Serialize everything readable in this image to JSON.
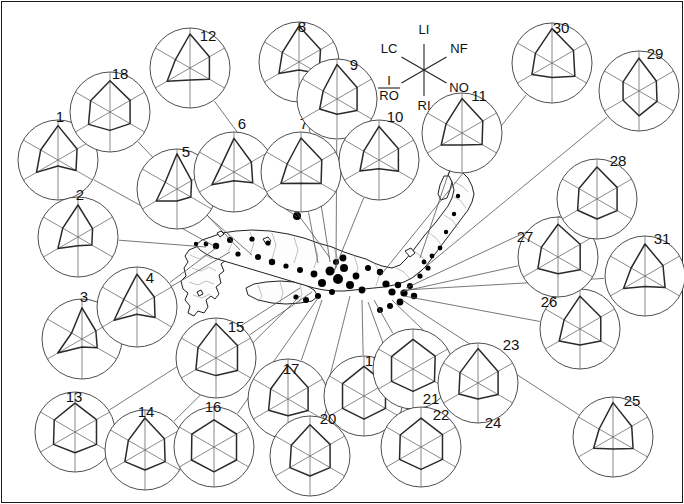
{
  "figure": {
    "title": "",
    "width": 684,
    "height": 504,
    "background_color": "#ffffff"
  },
  "legend": {
    "name": "axis-key",
    "center": {
      "x": 424,
      "y": 70
    },
    "radius": 26,
    "axes": [
      {
        "code": "LI",
        "label": "LI",
        "angle_deg": 90,
        "label_x": 424,
        "label_y": 34
      },
      {
        "code": "NF",
        "label": "NF",
        "angle_deg": 30,
        "label_x": 459,
        "label_y": 53
      },
      {
        "code": "NO",
        "label": "NO",
        "angle_deg": -30,
        "label_x": 459,
        "label_y": 92
      },
      {
        "code": "RI",
        "label": "RI",
        "angle_deg": -90,
        "label_x": 424,
        "label_y": 110
      },
      {
        "code": "I/RO",
        "label": "I/RO",
        "angle_deg": -150,
        "label_x": 389,
        "label_y": 92
      },
      {
        "code": "LC",
        "label": "LC",
        "angle_deg": 150,
        "label_x": 389,
        "label_y": 53
      }
    ],
    "fraction_numerator": "I",
    "fraction_denominator": "RO"
  },
  "chart_data": {
    "type": "radar",
    "axes": [
      "LI",
      "NF",
      "NO",
      "RI",
      "I/RO",
      "LC"
    ],
    "axis_order_deg": [
      90,
      30,
      -30,
      -90,
      -150,
      150
    ],
    "value_range": [
      0,
      1
    ],
    "grid": false,
    "legend_position": "top-center",
    "title": "",
    "xlabel": "",
    "ylabel": "",
    "series": [
      {
        "name": "1",
        "label": "1",
        "cx": 58,
        "cy": 160,
        "r": 40,
        "label_x": 60,
        "label_y": 122,
        "values": [
          0.86,
          0.55,
          0.52,
          0.15,
          0.62,
          0.5
        ]
      },
      {
        "name": "2",
        "label": "2",
        "cx": 78,
        "cy": 237,
        "r": 40,
        "label_x": 80,
        "label_y": 200,
        "values": [
          0.8,
          0.42,
          0.4,
          0.22,
          0.58,
          0.44
        ]
      },
      {
        "name": "3",
        "label": "3",
        "cx": 82,
        "cy": 339,
        "r": 40,
        "label_x": 84,
        "label_y": 302,
        "values": [
          0.78,
          0.4,
          0.44,
          0.2,
          0.7,
          0.3
        ]
      },
      {
        "name": "4",
        "label": "4",
        "cx": 137,
        "cy": 307,
        "r": 40,
        "label_x": 150,
        "label_y": 283,
        "values": [
          0.82,
          0.5,
          0.52,
          0.18,
          0.66,
          0.38
        ]
      },
      {
        "name": "5",
        "label": "5",
        "cx": 177,
        "cy": 189,
        "r": 40,
        "label_x": 186,
        "label_y": 157,
        "values": [
          0.88,
          0.42,
          0.4,
          0.3,
          0.6,
          0.34
        ]
      },
      {
        "name": "6",
        "label": "6",
        "cx": 234,
        "cy": 172,
        "r": 40,
        "label_x": 242,
        "label_y": 129,
        "values": [
          0.84,
          0.5,
          0.54,
          0.22,
          0.64,
          0.36
        ]
      },
      {
        "name": "7",
        "label": "7",
        "cx": 301,
        "cy": 172,
        "r": 40,
        "label_x": 304,
        "label_y": 129,
        "values": [
          0.85,
          0.6,
          0.58,
          0.28,
          0.58,
          0.4
        ]
      },
      {
        "name": "8",
        "label": "8",
        "cx": 299,
        "cy": 62,
        "r": 40,
        "label_x": 302,
        "label_y": 32,
        "values": [
          0.9,
          0.62,
          0.58,
          0.2,
          0.58,
          0.48
        ]
      },
      {
        "name": "9",
        "label": "9",
        "cx": 337,
        "cy": 99,
        "r": 40,
        "label_x": 354,
        "label_y": 70,
        "values": [
          0.86,
          0.58,
          0.58,
          0.38,
          0.5,
          0.4
        ]
      },
      {
        "name": "10",
        "label": "10",
        "cx": 379,
        "cy": 160,
        "r": 40,
        "label_x": 395,
        "label_y": 122,
        "values": [
          0.84,
          0.56,
          0.56,
          0.22,
          0.55,
          0.44
        ]
      },
      {
        "name": "11",
        "label": "11",
        "cx": 462,
        "cy": 133,
        "r": 40,
        "label_x": 479,
        "label_y": 101,
        "values": [
          0.86,
          0.6,
          0.58,
          0.3,
          0.6,
          0.46
        ]
      },
      {
        "name": "12",
        "label": "12",
        "cx": 190,
        "cy": 68,
        "r": 40,
        "label_x": 208,
        "label_y": 41,
        "values": [
          0.85,
          0.56,
          0.56,
          0.3,
          0.66,
          0.42
        ]
      },
      {
        "name": "13",
        "label": "13",
        "cx": 75,
        "cy": 432,
        "r": 40,
        "label_x": 74,
        "label_y": 402,
        "values": [
          0.72,
          0.62,
          0.62,
          0.52,
          0.62,
          0.6
        ]
      },
      {
        "name": "14",
        "label": "14",
        "cx": 145,
        "cy": 450,
        "r": 40,
        "label_x": 146,
        "label_y": 417,
        "values": [
          0.8,
          0.56,
          0.58,
          0.5,
          0.58,
          0.48
        ]
      },
      {
        "name": "15",
        "label": "15",
        "cx": 216,
        "cy": 358,
        "r": 40,
        "label_x": 236,
        "label_y": 332,
        "values": [
          0.86,
          0.62,
          0.62,
          0.44,
          0.58,
          0.52
        ]
      },
      {
        "name": "16",
        "label": "16",
        "cx": 214,
        "cy": 447,
        "r": 40,
        "label_x": 213,
        "label_y": 412,
        "values": [
          0.68,
          0.65,
          0.65,
          0.62,
          0.65,
          0.64
        ]
      },
      {
        "name": "17",
        "label": "17",
        "cx": 288,
        "cy": 399,
        "r": 40,
        "label_x": 291,
        "label_y": 374,
        "values": [
          0.84,
          0.58,
          0.58,
          0.42,
          0.56,
          0.5
        ]
      },
      {
        "name": "18",
        "label": "18",
        "cx": 110,
        "cy": 112,
        "r": 40,
        "label_x": 120,
        "label_y": 79,
        "values": [
          0.78,
          0.58,
          0.58,
          0.46,
          0.62,
          0.56
        ]
      },
      {
        "name": "19",
        "label": "19",
        "cx": 364,
        "cy": 396,
        "r": 40,
        "label_x": 373,
        "label_y": 366,
        "values": [
          0.74,
          0.62,
          0.62,
          0.58,
          0.62,
          0.62
        ]
      },
      {
        "name": "20",
        "label": "20",
        "cx": 310,
        "cy": 456,
        "r": 40,
        "label_x": 328,
        "label_y": 424,
        "values": [
          0.78,
          0.58,
          0.58,
          0.5,
          0.58,
          0.54
        ]
      },
      {
        "name": "21",
        "label": "21",
        "cx": 413,
        "cy": 369,
        "r": 40,
        "label_x": 431,
        "label_y": 404,
        "values": [
          0.74,
          0.64,
          0.62,
          0.56,
          0.62,
          0.62
        ]
      },
      {
        "name": "22",
        "label": "22",
        "cx": 421,
        "cy": 447,
        "r": 40,
        "label_x": 441,
        "label_y": 420,
        "values": [
          0.72,
          0.62,
          0.62,
          0.56,
          0.62,
          0.6
        ]
      },
      {
        "name": "23",
        "label": "23",
        "cx": 478,
        "cy": 383,
        "r": 40,
        "label_x": 511,
        "label_y": 350,
        "values": [
          0.86,
          0.58,
          0.58,
          0.4,
          0.55,
          0.52
        ]
      },
      {
        "name": "24",
        "label": "24",
        "cx": 477,
        "cy": 385,
        "r": 0,
        "label_x": 493,
        "label_y": 428,
        "values": [
          0,
          0,
          0,
          0,
          0,
          0
        ]
      },
      {
        "name": "25",
        "label": "25",
        "cx": 613,
        "cy": 437,
        "r": 40,
        "label_x": 632,
        "label_y": 406,
        "values": [
          0.86,
          0.54,
          0.58,
          0.3,
          0.56,
          0.4
        ]
      },
      {
        "name": "26",
        "label": "26",
        "cx": 580,
        "cy": 329,
        "r": 40,
        "label_x": 549,
        "label_y": 307,
        "values": [
          0.82,
          0.6,
          0.6,
          0.4,
          0.6,
          0.46
        ]
      },
      {
        "name": "27",
        "label": "27",
        "cx": 558,
        "cy": 257,
        "r": 40,
        "label_x": 525,
        "label_y": 242,
        "values": [
          0.82,
          0.64,
          0.64,
          0.42,
          0.58,
          0.48
        ]
      },
      {
        "name": "28",
        "label": "28",
        "cx": 597,
        "cy": 199,
        "r": 40,
        "label_x": 618,
        "label_y": 166,
        "values": [
          0.8,
          0.58,
          0.58,
          0.5,
          0.56,
          0.52
        ]
      },
      {
        "name": "29",
        "label": "29",
        "cx": 639,
        "cy": 91,
        "r": 40,
        "label_x": 655,
        "label_y": 59,
        "values": [
          0.82,
          0.5,
          0.52,
          0.62,
          0.46,
          0.46
        ]
      },
      {
        "name": "30",
        "label": "30",
        "cx": 552,
        "cy": 63,
        "r": 40,
        "label_x": 561,
        "label_y": 33,
        "values": [
          0.86,
          0.62,
          0.66,
          0.36,
          0.58,
          0.48
        ]
      },
      {
        "name": "31",
        "label": "31",
        "cx": 645,
        "cy": 276,
        "r": 40,
        "label_x": 662,
        "label_y": 244,
        "values": [
          0.8,
          0.52,
          0.58,
          0.26,
          0.62,
          0.4
        ]
      }
    ]
  },
  "map": {
    "name": "japan-map",
    "region": "Western and Central Japan (Kyushu, Shikoku, Honshu)",
    "site_count": 31
  }
}
